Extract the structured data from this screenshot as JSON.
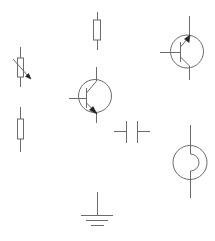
{
  "diagram": {
    "type": "circuit-symbol-palette",
    "background": "#ffffff",
    "stroke_color": "#6b6b6b",
    "arrow_color": "#222222",
    "components": [
      {
        "id": "resistor-top",
        "kind": "resistor",
        "label": ""
      },
      {
        "id": "variable-resistor",
        "kind": "variable-resistor",
        "label": ""
      },
      {
        "id": "resistor-left",
        "kind": "resistor",
        "label": ""
      },
      {
        "id": "npn-transistor",
        "kind": "npn-transistor",
        "label": ""
      },
      {
        "id": "pnp-transistor",
        "kind": "pnp-transistor",
        "label": ""
      },
      {
        "id": "capacitor",
        "kind": "capacitor",
        "label": ""
      },
      {
        "id": "lamp-source",
        "kind": "circle-source",
        "label": ""
      },
      {
        "id": "ground",
        "kind": "ground",
        "label": ""
      }
    ]
  }
}
